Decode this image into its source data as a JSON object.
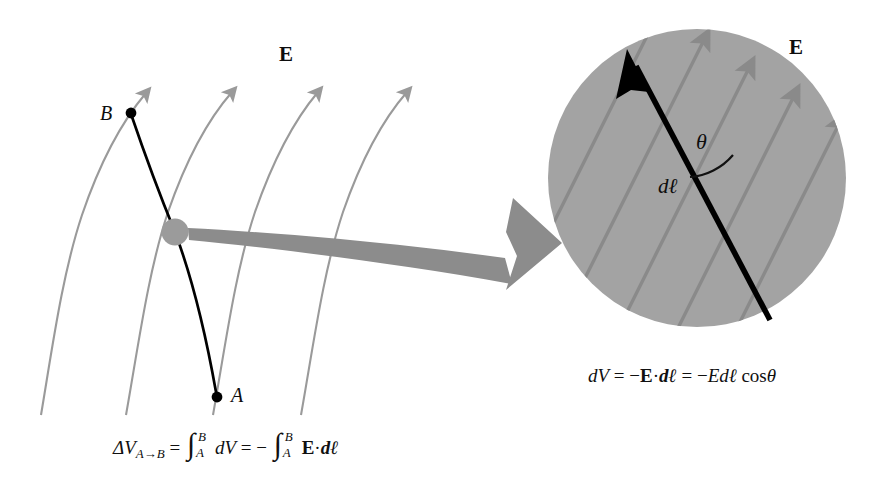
{
  "figure": {
    "title_visible": false,
    "background_color": "#ffffff",
    "field_line_color": "#9a9a9a",
    "path_color": "#000000",
    "inset_fill_color": "#a3a3a3",
    "callout_arrow_color": "#8c8c8c"
  },
  "left_panel": {
    "field_label": "E",
    "point_b_label": "B",
    "point_a_label": "A",
    "field_line_count": 4,
    "description_visible": false
  },
  "inset_panel": {
    "field_label": "E",
    "angle_label": "θ",
    "displacement_label": "dℓ",
    "hatch_line_count": 6
  },
  "equations": {
    "main": {
      "lhs_delta": "ΔV",
      "lhs_sub": "A→B",
      "eq1": "=",
      "int1_lower": "A",
      "int1_upper": "B",
      "int1_body": "dV",
      "eq2": "=",
      "minus": "−",
      "int2_lower": "A",
      "int2_upper": "B",
      "int2_vec": "E",
      "int2_dot": "·",
      "int2_body": "dℓ"
    },
    "inset": {
      "lhs": "dV",
      "eq1": "=",
      "minus1": "−",
      "vec": "E",
      "dot": "·",
      "dl": "dℓ",
      "eq2": "=",
      "minus2": "−",
      "E": "E",
      "d": "d",
      "ell": "ℓ",
      "cos": "cos",
      "theta": "θ"
    }
  }
}
